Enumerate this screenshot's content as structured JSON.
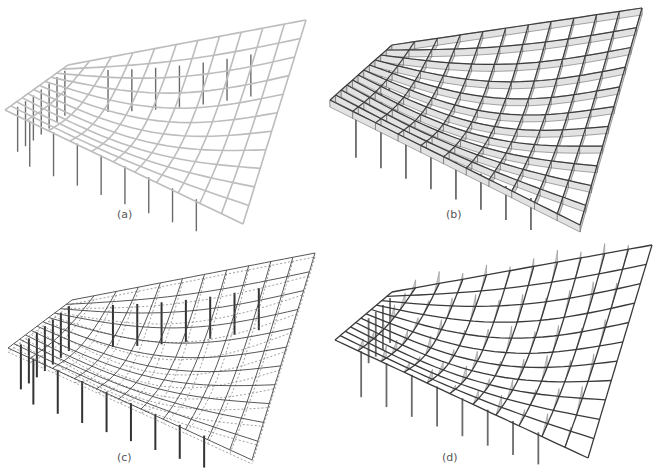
{
  "figure": {
    "panels": [
      {
        "id": "a",
        "label": "(a)",
        "style": "light-wireframe",
        "description": "Gridshell roof structure with supporting columns (undeformed, light members)"
      },
      {
        "id": "b",
        "label": "(b)",
        "style": "deep-beams",
        "description": "Gridshell with member cross-section depths shown as grey strips"
      },
      {
        "id": "c",
        "label": "(c)",
        "style": "deformed-dashed",
        "description": "Wireframe gridshell with deformed shape shown as dotted lines"
      },
      {
        "id": "d",
        "label": "(d)",
        "style": "force-diagram",
        "description": "Gridshell with grey triangular internal force/moment diagrams"
      }
    ],
    "colors": {
      "light_member": "#bdbdbd",
      "dark_member": "#4a4a4a",
      "fill_grey": "#cfcfcf",
      "column": "#6b6b6b",
      "label": "#555555"
    }
  }
}
